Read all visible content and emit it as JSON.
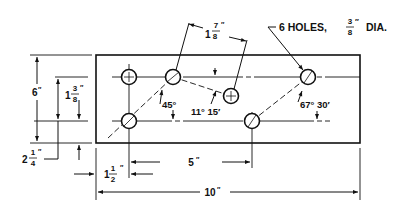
{
  "drawing": {
    "title": "Plate with six holes",
    "colors": {
      "ink": "#111111",
      "background": "#ffffff"
    },
    "callout": {
      "label": "6 HOLES,",
      "frac_num": "3",
      "frac_den": "8",
      "unit": "″",
      "suffix": "DIA."
    },
    "dimensions": {
      "overall_height": {
        "whole": "6",
        "unit": "″"
      },
      "hole_row_spacing": {
        "whole": "1",
        "num": "3",
        "den": "8",
        "unit": "″"
      },
      "bottom_offset": {
        "whole": "2",
        "num": "1",
        "den": "4",
        "unit": "″"
      },
      "left_offset": {
        "whole": "1",
        "num": "1",
        "den": "2",
        "unit": "″"
      },
      "hole_spacing": {
        "whole": "5",
        "unit": "″"
      },
      "overall_length": {
        "whole": "10",
        "unit": "″"
      },
      "diagonal_distance": {
        "whole": "1",
        "num": "7",
        "den": "8",
        "unit": "″"
      }
    },
    "angles": {
      "a1": "45°",
      "a2": "11° 15′",
      "a3": "67° 30′"
    }
  }
}
